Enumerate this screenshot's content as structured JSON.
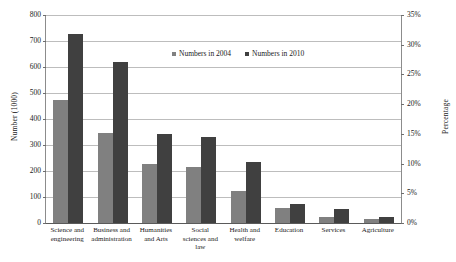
{
  "chart_data": {
    "type": "bar",
    "title": "",
    "xlabel": "",
    "ylabel": "Number (1000)",
    "y2label": "Percentage",
    "categories": [
      "Science and engineering",
      "Business and administration",
      "Humanities and Arts",
      "Social sciences and law",
      "Health and welfare",
      "Education",
      "Services",
      "Agriculture"
    ],
    "series": [
      {
        "name": "Numbers in 2004",
        "color": "#808080",
        "values": [
          473,
          345,
          228,
          215,
          125,
          57,
          24,
          14
        ]
      },
      {
        "name": "Numbers in 2010",
        "color": "#404040",
        "values": [
          727,
          620,
          344,
          330,
          233,
          74,
          55,
          24
        ]
      }
    ],
    "ylim": [
      0,
      800
    ],
    "y2lim": [
      0,
      35
    ],
    "yticks": [
      0,
      100,
      200,
      300,
      400,
      500,
      600,
      700,
      800
    ],
    "ytick_labels": [
      "0",
      "100",
      "200",
      "300",
      "400",
      "500",
      "600",
      "700",
      "800"
    ],
    "y2ticks": [
      0,
      5,
      10,
      15,
      20,
      25,
      30,
      35
    ],
    "y2tick_labels": [
      "0%",
      "5%",
      "10%",
      "15%",
      "20%",
      "25%",
      "30%",
      "35%"
    ],
    "grid": true,
    "legend_position": "top-center"
  },
  "axes": {
    "left_title": "Number (1000)",
    "right_title": "Percentage"
  },
  "legend": {
    "entries": [
      {
        "label": "Numbers in 2004",
        "swatch": "legend-swatch-2004"
      },
      {
        "label": "Numbers in 2010",
        "swatch": "legend-swatch-2010"
      }
    ]
  }
}
